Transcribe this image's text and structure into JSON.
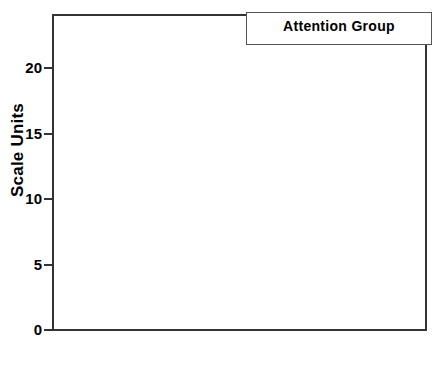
{
  "chart_data": {
    "type": "bar",
    "title": "",
    "xlabel": "",
    "ylabel": "Scale Units",
    "categories": [
      "Emotionality",
      "Soothability"
    ],
    "ylim": [
      0,
      23
    ],
    "yticks": [
      0,
      5,
      10,
      15,
      20
    ],
    "ytick_labels": [
      "0",
      "5",
      "10",
      "15",
      "20"
    ],
    "grid": false,
    "legend_position": "top-right",
    "legend_title": "Attention Group",
    "series": [
      {
        "name": "Low",
        "fill": "solid-black",
        "color": "#140d0b",
        "values": [
          16.9,
          14.1
        ]
      },
      {
        "name": "High",
        "fill": "diagonal-hatch",
        "color": "#ffffff",
        "values": [
          13.2,
          18.2
        ]
      },
      {
        "name": "Average",
        "fill": "white",
        "color": "#ffffff",
        "values": [
          13.2,
          16.6
        ]
      }
    ]
  },
  "axes": {
    "y_title": "Scale Units",
    "y_tick_labels": [
      "20",
      "15",
      "10",
      "5",
      "0"
    ]
  },
  "legend": {
    "title": "Attention Group",
    "entries": [
      {
        "label": "Low",
        "swatch": "solid-black-swatch-icon"
      },
      {
        "label": "High",
        "swatch": "hatched-swatch-icon"
      },
      {
        "label": "Average",
        "swatch": "white-swatch-icon"
      }
    ]
  },
  "categories": [
    {
      "label": "Emotionality"
    },
    {
      "label": "Soothability"
    }
  ]
}
